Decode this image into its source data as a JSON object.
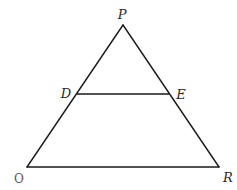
{
  "diagram": {
    "type": "triangle-with-parallel-segment",
    "stroke_color": "#1a1a1a",
    "background": "#ffffff",
    "points": {
      "P": {
        "label": "P",
        "x": 123,
        "y": 25,
        "label_x": 122,
        "label_y": 15
      },
      "D": {
        "label": "D",
        "x": 77,
        "y": 94,
        "label_x": 66,
        "label_y": 98
      },
      "E": {
        "label": "E",
        "x": 169,
        "y": 94,
        "label_x": 180,
        "label_y": 99
      },
      "O": {
        "label": "O",
        "x": 27,
        "y": 167,
        "label_x": 19,
        "label_y": 182
      },
      "R": {
        "label": "R",
        "x": 219,
        "y": 167,
        "label_x": 228,
        "label_y": 181
      }
    },
    "segments": [
      {
        "from": "P",
        "to": "O",
        "name": "side-PO"
      },
      {
        "from": "P",
        "to": "R",
        "name": "side-PR"
      },
      {
        "from": "O",
        "to": "R",
        "name": "base-OR"
      },
      {
        "from": "D",
        "to": "E",
        "name": "segment-DE"
      }
    ]
  }
}
